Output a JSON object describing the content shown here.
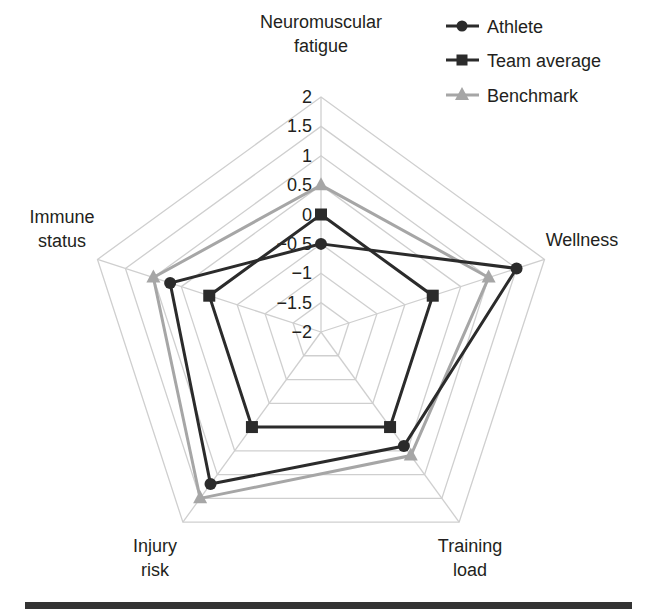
{
  "chart_data": {
    "type": "radar",
    "title": "",
    "axes": [
      {
        "name": "Neuromuscular fatigue",
        "lines": [
          "Neuromuscular",
          "fatigue"
        ]
      },
      {
        "name": "Wellness",
        "lines": [
          "Wellness"
        ]
      },
      {
        "name": "Training load",
        "lines": [
          "Training",
          "load"
        ]
      },
      {
        "name": "Injury risk",
        "lines": [
          "Injury",
          "risk"
        ]
      },
      {
        "name": "Immune status",
        "lines": [
          "Immune",
          "status"
        ]
      }
    ],
    "range": [
      -2,
      2
    ],
    "ticks": [
      "2",
      "1.5",
      "1",
      "0.5",
      "0",
      "−0.5",
      "−1",
      "−1.5",
      "−2"
    ],
    "tick_values": [
      2,
      1.5,
      1,
      0.5,
      0,
      -0.5,
      -1,
      -1.5,
      -2
    ],
    "grid": true,
    "legend_position": "top-right",
    "series": [
      {
        "name": "Athlete",
        "marker": "circle",
        "color": "#2b2b2b",
        "values": [
          -0.5,
          1.5,
          0.4,
          1.2,
          0.7
        ]
      },
      {
        "name": "Team average",
        "marker": "square",
        "color": "#2b2b2b",
        "values": [
          0,
          0,
          0,
          0,
          0
        ]
      },
      {
        "name": "Benchmark",
        "marker": "triangle",
        "color": "#a6a6a6",
        "values": [
          0.5,
          1.0,
          0.6,
          1.5,
          1.0
        ]
      }
    ]
  },
  "legend": {
    "items": [
      {
        "label": "Athlete"
      },
      {
        "label": "Team average"
      },
      {
        "label": "Benchmark"
      }
    ]
  }
}
